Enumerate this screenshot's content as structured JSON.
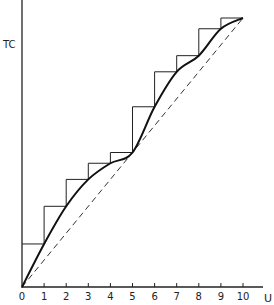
{
  "chart_data": {
    "type": "line",
    "title": "",
    "xlabel": "U",
    "ylabel": "TC",
    "x_ticks": [
      "0",
      "1",
      "2",
      "3",
      "4",
      "5",
      "6",
      "7",
      "8",
      "9",
      "10"
    ],
    "xlim": [
      0,
      10
    ],
    "grid": false,
    "legend": null,
    "series": [
      {
        "name": "step function (discrete TC)",
        "style": "thin solid step",
        "x": [
          0,
          1,
          2,
          3,
          4,
          5,
          6,
          7,
          8,
          9,
          10
        ],
        "values": [
          1.6,
          3.0,
          4.0,
          4.6,
          5.0,
          6.7,
          8.0,
          8.6,
          9.6,
          10.0,
          10.0
        ]
      },
      {
        "name": "smooth TC curve",
        "style": "thick solid",
        "x": [
          0,
          1,
          2,
          3,
          4,
          5,
          6,
          7,
          8,
          9,
          10
        ],
        "values": [
          0,
          1.6,
          3.0,
          4.0,
          4.6,
          5.0,
          6.7,
          8.0,
          8.6,
          9.6,
          10.0
        ]
      },
      {
        "name": "linear reference",
        "style": "dashed",
        "x": [
          0,
          10
        ],
        "values": [
          0,
          10
        ]
      }
    ]
  },
  "labels": {
    "y_axis": "TC",
    "x_axis": "U",
    "ticks": [
      "0",
      "1",
      "2",
      "3",
      "4",
      "5",
      "6",
      "7",
      "8",
      "9",
      "10"
    ]
  }
}
